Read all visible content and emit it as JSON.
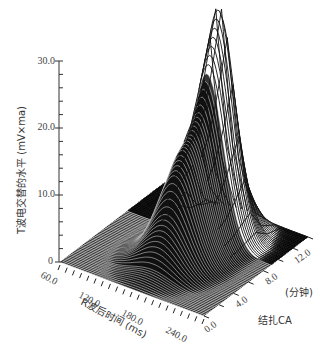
{
  "chart_data": {
    "type": "surface-3d",
    "title": "",
    "zlabel": "T波电交替的水平 (mV×ma)",
    "xlabel": "R波后时间 (ms)",
    "ylabel_line1": "(分钟)",
    "ylabel_line2": "结扎CA",
    "z_ticks": [
      "0",
      "10.0",
      "20.0",
      "30.0"
    ],
    "z_range": [
      0,
      30
    ],
    "x_ticks": [
      "60.0",
      "120.0",
      "180.0",
      "240.0"
    ],
    "x_range": [
      60,
      260
    ],
    "y_ticks": [
      "0.0",
      "4.0",
      "8.0",
      "12.0"
    ],
    "y_range": [
      0,
      14
    ],
    "grid": false,
    "legend": null,
    "peak": {
      "time_ms": 170,
      "minutes": 10.5,
      "value": 34
    },
    "series": [
      {
        "minutes": 0.0,
        "peak_value": 0.3
      },
      {
        "minutes": 2.0,
        "peak_value": 1.5
      },
      {
        "minutes": 4.0,
        "peak_value": 8.0
      },
      {
        "minutes": 5.0,
        "peak_value": 13.0
      },
      {
        "minutes": 6.0,
        "peak_value": 16.0
      },
      {
        "minutes": 7.0,
        "peak_value": 17.5
      },
      {
        "minutes": 8.0,
        "peak_value": 20.0
      },
      {
        "minutes": 9.0,
        "peak_value": 25.0
      },
      {
        "minutes": 10.5,
        "peak_value": 34.0
      },
      {
        "minutes": 12.0,
        "peak_value": 12.0
      },
      {
        "minutes": 14.0,
        "peak_value": 0.5
      }
    ]
  }
}
